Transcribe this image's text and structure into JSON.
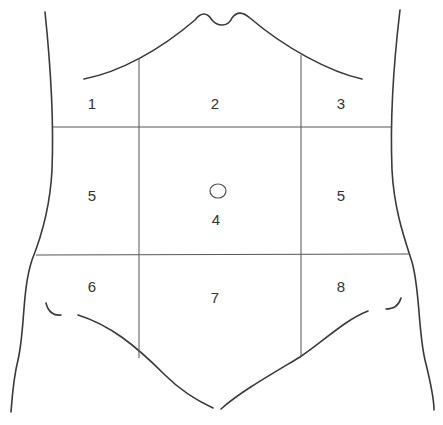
{
  "diagram": {
    "type": "abdominal-regions",
    "colors": {
      "stroke": "#3a3a3a",
      "background": "#ffffff",
      "text": "#333333"
    },
    "regions": [
      {
        "id": "r1",
        "label": "1",
        "x": 92,
        "y": 109
      },
      {
        "id": "r2",
        "label": "2",
        "x": 215,
        "y": 109
      },
      {
        "id": "r3",
        "label": "3",
        "x": 341,
        "y": 109
      },
      {
        "id": "r5-left",
        "label": "5",
        "x": 92,
        "y": 201
      },
      {
        "id": "r4",
        "label": "4",
        "x": 216,
        "y": 225
      },
      {
        "id": "r5-right",
        "label": "5",
        "x": 341,
        "y": 201
      },
      {
        "id": "r6",
        "label": "6",
        "x": 92,
        "y": 292
      },
      {
        "id": "r7",
        "label": "7",
        "x": 215,
        "y": 303
      },
      {
        "id": "r8",
        "label": "8",
        "x": 341,
        "y": 292
      }
    ],
    "navel": {
      "cx": 218,
      "cy": 191,
      "rx": 8,
      "ry": 7
    }
  }
}
